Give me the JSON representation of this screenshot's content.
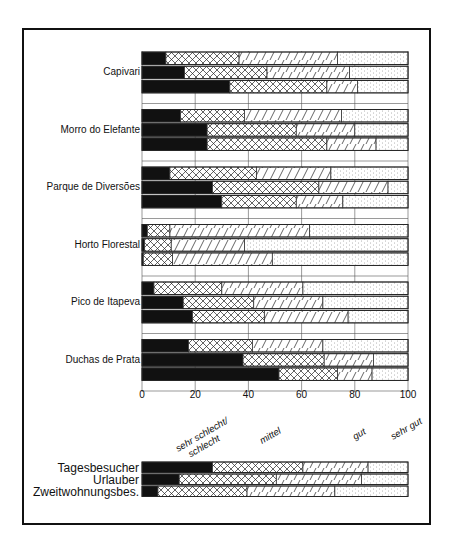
{
  "chart_data": [
    {
      "type": "bar",
      "orientation": "horizontal",
      "stacked": true,
      "title": "",
      "xlabel": "",
      "ylabel": "",
      "xlim": [
        0,
        100
      ],
      "x_ticks": [
        "0",
        "20",
        "40",
        "60",
        "80",
        "100"
      ],
      "grid": true,
      "segment_order": [
        "sehr schlecht/schlecht",
        "mittel",
        "gut",
        "sehr gut"
      ],
      "series_order": [
        "Tagesbesucher",
        "Urlauber",
        "Zweitwohnungsbes."
      ],
      "groups": [
        {
          "label": "Capivari",
          "bars": [
            {
              "series": "Tagesbesucher",
              "values": [
                9,
                27.5,
                37,
                26.5
              ]
            },
            {
              "series": "Urlauber",
              "values": [
                16,
                31,
                31,
                22
              ]
            },
            {
              "series": "Zweitwohnungsbes.",
              "values": [
                33,
                36.5,
                11.5,
                19
              ]
            }
          ]
        },
        {
          "label": "Morro do Elefante",
          "bars": [
            {
              "series": "Tagesbesucher",
              "values": [
                14.5,
                24,
                36.5,
                25
              ]
            },
            {
              "series": "Urlauber",
              "values": [
                24.5,
                33.5,
                22,
                20
              ]
            },
            {
              "series": "Zweitwohnungsbes.",
              "values": [
                24.5,
                45,
                18.5,
                12
              ]
            }
          ]
        },
        {
          "label": "Parque de Diversões",
          "bars": [
            {
              "series": "Tagesbesucher",
              "values": [
                10.5,
                32.5,
                28,
                29
              ]
            },
            {
              "series": "Urlauber",
              "values": [
                26.5,
                40,
                26,
                7.5
              ]
            },
            {
              "series": "Zweitwohnungsbes.",
              "values": [
                30,
                28,
                17.5,
                24.5
              ]
            }
          ]
        },
        {
          "label": "Horto Florestal",
          "bars": [
            {
              "series": "Tagesbesucher",
              "values": [
                2,
                8.5,
                52.5,
                37
              ]
            },
            {
              "series": "Urlauber",
              "values": [
                1,
                10,
                27.5,
                61.5
              ]
            },
            {
              "series": "Zweitwohnungsbes.",
              "values": [
                0.5,
                11,
                37.5,
                51
              ]
            }
          ]
        },
        {
          "label": "Pico de Itapeva",
          "bars": [
            {
              "series": "Tagesbesucher",
              "values": [
                4.5,
                25.5,
                30.5,
                39.5
              ]
            },
            {
              "series": "Urlauber",
              "values": [
                15.5,
                26.5,
                26,
                32
              ]
            },
            {
              "series": "Zweitwohnungsbes.",
              "values": [
                19,
                27,
                31.5,
                22.5
              ]
            }
          ]
        },
        {
          "label": "Duchas de Prata",
          "bars": [
            {
              "series": "Tagesbesucher",
              "values": [
                17.5,
                24,
                26.5,
                32
              ]
            },
            {
              "series": "Urlauber",
              "values": [
                38,
                30.5,
                18.5,
                13
              ]
            },
            {
              "series": "Zweitwohnungsbes.",
              "values": [
                51.5,
                22,
                13,
                13.5
              ]
            }
          ]
        }
      ]
    },
    {
      "type": "bar",
      "orientation": "horizontal",
      "stacked": true,
      "title": "",
      "role": "legend / overall summary",
      "xlim": [
        0,
        100
      ],
      "segment_labels": [
        "sehr schlecht/ schlecht",
        "mittel",
        "gut",
        "sehr gut"
      ],
      "categories": [
        "Tagesbesucher",
        "Urlauber",
        "Zweitwohnungsbes."
      ],
      "bars": [
        {
          "label": "Tagesbesucher",
          "values": [
            26.5,
            34,
            24.5,
            15
          ]
        },
        {
          "label": "Urlauber",
          "values": [
            14,
            36.5,
            32,
            17.5
          ]
        },
        {
          "label": "Zweitwohnungsbes.",
          "values": [
            6,
            33.5,
            33,
            27.5
          ]
        }
      ]
    }
  ],
  "legend": {
    "labels": [
      {
        "line1": "sehr schlecht/",
        "line2": "schlecht"
      },
      {
        "line1": "mittel"
      },
      {
        "line1": "gut"
      },
      {
        "line1": "sehr gut"
      }
    ]
  },
  "patterns": [
    "solid-black",
    "crosshatch",
    "diagonal-hatch",
    "dotted"
  ]
}
